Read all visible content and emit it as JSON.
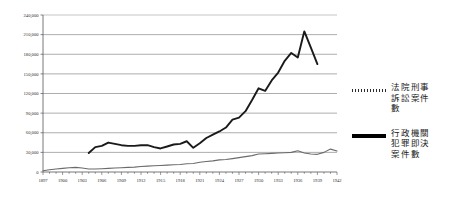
{
  "chart_data": {
    "type": "line",
    "title": "",
    "xlabel": "",
    "ylabel": "",
    "xlim": [
      1897,
      1942
    ],
    "ylim": [
      0,
      240000
    ],
    "grid": true,
    "legend_position": "right",
    "y_ticks": [
      "0",
      "30,000",
      "60,000",
      "90,000",
      "120,000",
      "150,000",
      "180,000",
      "210,000",
      "240,000"
    ],
    "y_tick_values": [
      0,
      30000,
      60000,
      90000,
      120000,
      150000,
      180000,
      210000,
      240000
    ],
    "x_ticks": [
      "1897",
      "1900",
      "1903",
      "1906",
      "1909",
      "1912",
      "1915",
      "1918",
      "1921",
      "1924",
      "1927",
      "1930",
      "1933",
      "1936",
      "1939",
      "1942"
    ],
    "x_tick_values": [
      1897,
      1900,
      1903,
      1906,
      1909,
      1912,
      1915,
      1918,
      1921,
      1924,
      1927,
      1930,
      1933,
      1936,
      1939,
      1942
    ],
    "series": [
      {
        "name": "法院刑事訴訟案件數",
        "style": "thick-dark",
        "x": [
          1904,
          1905,
          1906,
          1907,
          1908,
          1909,
          1910,
          1911,
          1912,
          1913,
          1914,
          1915,
          1916,
          1917,
          1918,
          1919,
          1920,
          1921,
          1922,
          1923,
          1924,
          1925,
          1926,
          1927,
          1928,
          1929,
          1930,
          1931,
          1932,
          1933,
          1934,
          1935,
          1936,
          1937,
          1938,
          1939
        ],
        "values": [
          29000,
          38000,
          40000,
          45000,
          43000,
          41000,
          40000,
          40000,
          41000,
          41000,
          38000,
          36000,
          39000,
          42000,
          43000,
          47000,
          37000,
          44000,
          52000,
          57000,
          62000,
          68000,
          80000,
          83000,
          93000,
          110000,
          128000,
          124000,
          140000,
          152000,
          170000,
          182000,
          175000,
          215000,
          190000,
          165000
        ]
      },
      {
        "name": "行政機關犯罪即決案件數",
        "style": "thin-gray",
        "x": [
          1897,
          1898,
          1899,
          1900,
          1901,
          1902,
          1903,
          1904,
          1905,
          1906,
          1907,
          1908,
          1909,
          1910,
          1911,
          1912,
          1913,
          1914,
          1915,
          1916,
          1917,
          1918,
          1919,
          1920,
          1921,
          1922,
          1923,
          1924,
          1925,
          1926,
          1927,
          1928,
          1929,
          1930,
          1931,
          1932,
          1933,
          1934,
          1935,
          1936,
          1937,
          1938,
          1939,
          1940,
          1941,
          1942
        ],
        "values": [
          2000,
          3500,
          4500,
          5500,
          6500,
          7000,
          6000,
          4500,
          4500,
          5000,
          5500,
          6000,
          6500,
          7000,
          7500,
          8500,
          9000,
          9500,
          10000,
          10500,
          11000,
          11500,
          12500,
          13000,
          15000,
          16000,
          17000,
          18500,
          19000,
          20500,
          22000,
          23500,
          25000,
          27500,
          28000,
          28500,
          29000,
          29500,
          30000,
          32500,
          29000,
          27500,
          27000,
          30000,
          35000,
          32000
        ]
      }
    ]
  },
  "legend": {
    "entries": [
      {
        "swatch": "hatched-line-swatch",
        "label": "法院刑事\n訴訟案件\n數",
        "lines": [
          "法院刑事",
          "訴訟案件",
          "數"
        ]
      },
      {
        "swatch": "solid-line-swatch",
        "label": "行政機關\n犯罪即決\n案件數",
        "lines": [
          "行政機關",
          "犯罪即決",
          "案件數"
        ]
      }
    ]
  },
  "colors": {
    "series_court": "#1a1a1a",
    "series_admin": "#6b6b6b",
    "gridline": "#8a8a8a",
    "axis": "#555555",
    "background": "#ffffff"
  }
}
